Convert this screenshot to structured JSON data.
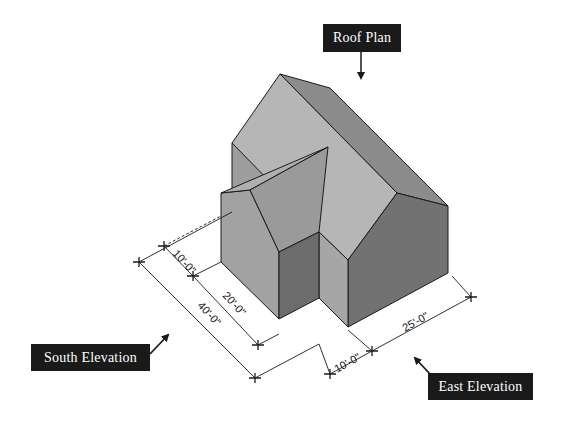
{
  "labels": {
    "roof_plan": "Roof Plan",
    "south_elevation": "South Elevation",
    "east_elevation": "East Elevation"
  },
  "dimensions": {
    "south_wing_depth": "10'-0\"",
    "south_main_offset": "20'-0\"",
    "south_total": "40'-0\"",
    "east_wing_width": "10'-0\"",
    "east_main_width": "25'-0\""
  },
  "colors": {
    "label_bg": "#1a1a1a",
    "label_text": "#ffffff",
    "roof_light": "#b4b4b4",
    "roof_mid": "#9a9a9a",
    "wall_left": "#a0a0a0",
    "wall_dark": "#6e6e6e",
    "wall_mid": "#8a8a8a",
    "line": "#1a1a1a"
  }
}
